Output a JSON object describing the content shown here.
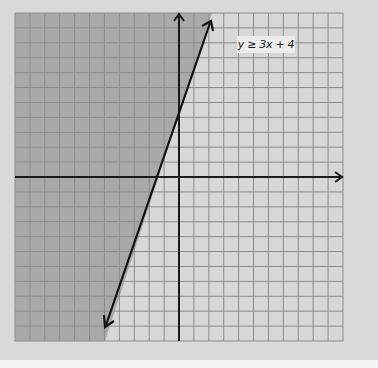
{
  "chart_data": {
    "type": "line",
    "title": "",
    "annotation": "y ≥ 3x + 4",
    "xlabel": "",
    "ylabel": "",
    "xlim": [
      -11,
      11
    ],
    "ylim": [
      -11,
      11
    ],
    "grid": true,
    "grid_step": 1,
    "series": [
      {
        "name": "boundary line y = 3x + 4",
        "style": "solid",
        "arrows": "both",
        "x": [
          -5,
          2.33
        ],
        "y": [
          -11,
          11
        ]
      }
    ],
    "shaded_region": "left/above boundary line (y ≥ 3x + 4)",
    "colors": {
      "background": "#dadada",
      "plot_unshaded": "#d7d7d7",
      "plot_shaded": "#a9a9a9",
      "grid_line": "#8c8c8c",
      "axis": "#1a1a1a",
      "label_box": "#ececec"
    }
  },
  "graph": {
    "label": "y ≥ 3x + 4"
  }
}
